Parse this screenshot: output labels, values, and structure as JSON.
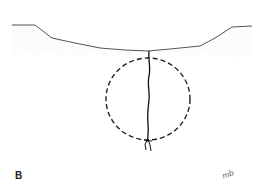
{
  "figure": {
    "panel_label": "B",
    "signature": "mb",
    "colors": {
      "background": "#ffffff",
      "surface_line": "#555555",
      "stipple": "#9a9a9a",
      "tract": "#111111",
      "dashed_circle": "#222222"
    },
    "elements": {
      "tissue_layer": "stippled surface layer with depression at center",
      "tract": "vertical wavy line from surface through circle",
      "circle": "dashed circular outline below surface",
      "knot": "small knot/branching at bottom of tract"
    }
  }
}
